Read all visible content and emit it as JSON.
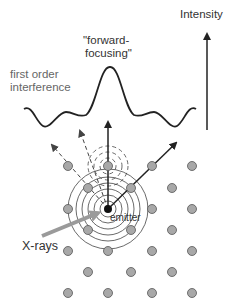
{
  "labels": {
    "intensity": "Intensity",
    "forward_line1": "\"forward-",
    "forward_line2": "focusing\"",
    "first_order_line1": "first order",
    "first_order_line2": "interference",
    "emitter": "emitter",
    "xrays": "X-rays"
  },
  "colors": {
    "curve": "#222222",
    "atom_fill": "#a8a8a8",
    "atom_stroke": "#555555",
    "emitter": "#111111",
    "xray_arrow": "#9a9a9a",
    "label_gray": "#666666"
  },
  "atoms": [
    [
      68,
      166
    ],
    [
      108,
      166
    ],
    [
      152,
      166
    ],
    [
      192,
      166
    ],
    [
      88,
      188
    ],
    [
      131,
      188
    ],
    [
      172,
      188
    ],
    [
      68,
      209
    ],
    [
      152,
      209
    ],
    [
      192,
      209
    ],
    [
      88,
      230
    ],
    [
      131,
      230
    ],
    [
      172,
      230
    ],
    [
      68,
      251
    ],
    [
      108,
      251
    ],
    [
      152,
      251
    ],
    [
      192,
      251
    ],
    [
      88,
      272
    ],
    [
      131,
      272
    ],
    [
      172,
      272
    ],
    [
      68,
      293
    ],
    [
      108,
      293
    ],
    [
      152,
      293
    ],
    [
      192,
      293
    ]
  ],
  "emitter": [
    108,
    209
  ]
}
